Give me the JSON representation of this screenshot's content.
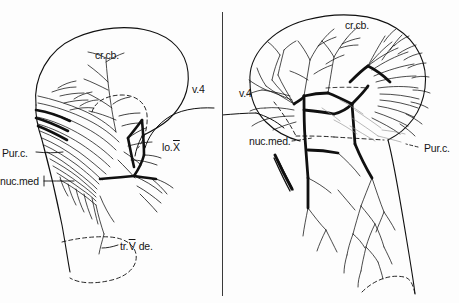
{
  "figure": {
    "kind": "anatomical-line-drawing",
    "background_color": "#fdfdfd",
    "ink_color": "#101010",
    "panel_count": 2,
    "divider": "vertical-rule"
  },
  "panels": [
    {
      "id": "left",
      "name": "left-panel",
      "labels": [
        {
          "id": "crcb",
          "text": "cr.cb.",
          "leader": "none"
        },
        {
          "id": "v4",
          "text": "v.4",
          "leader": "none"
        },
        {
          "id": "lox",
          "text": "lo.",
          "roman": "X",
          "leader": "none"
        },
        {
          "id": "purc",
          "text": "Pur.c.",
          "leader": "solid"
        },
        {
          "id": "nucmed",
          "text": "nuc.med",
          "leader": "solid"
        },
        {
          "id": "trvde",
          "pre": "tr.",
          "roman": "V",
          "post": " de.",
          "leader": "solid"
        }
      ]
    },
    {
      "id": "right",
      "name": "right-panel",
      "labels": [
        {
          "id": "crcb",
          "text": "cr.cb.",
          "leader": "none"
        },
        {
          "id": "v4",
          "text": "v.4",
          "leader": "none"
        },
        {
          "id": "nucmed",
          "text": "nuc.med.",
          "leader": "dashed"
        },
        {
          "id": "purc",
          "text": "Pur.c.",
          "leader": "dashed"
        }
      ]
    }
  ]
}
